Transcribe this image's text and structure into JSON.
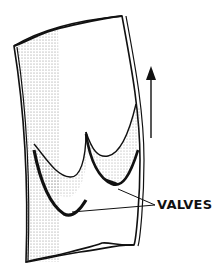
{
  "diagram": {
    "labels": [
      {
        "text": "VALVES",
        "points_to": [
          "valve-left",
          "valve-right"
        ]
      }
    ],
    "arrow": {
      "direction": "up",
      "meaning": "blood-flow"
    },
    "colors": {
      "ink": "#111111",
      "stipple": "#b8b8b8",
      "background": "#ffffff"
    }
  }
}
